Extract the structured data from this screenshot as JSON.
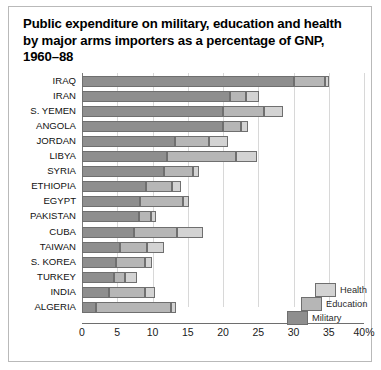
{
  "chart_data": {
    "type": "bar",
    "subtype": "stacked-horizontal",
    "title": "Public expenditure on military, education and health by major arms importers as a percentage of GNP, 1960–88",
    "xlabel": "",
    "ylabel": "",
    "xlim": [
      0,
      40
    ],
    "xticks": [
      0,
      5,
      10,
      15,
      20,
      25,
      30,
      35,
      40
    ],
    "xtick_labels": [
      "0",
      "5",
      "10",
      "15",
      "20",
      "25",
      "30",
      "35",
      "40%"
    ],
    "grid": true,
    "legend_position": "inside-lower-right",
    "categories": [
      "IRAQ",
      "IRAN",
      "S. YEMEN",
      "ANGOLA",
      "JORDAN",
      "LIBYA",
      "SYRIA",
      "ETHIOPIA",
      "EGYPT",
      "PAKISTAN",
      "CUBA",
      "TAIWAN",
      "S. KOREA",
      "TURKEY",
      "INDIA",
      "ALGERIA"
    ],
    "series": [
      {
        "name": "Military",
        "color": "#8e8e8e",
        "values": [
          30.0,
          21.0,
          20.0,
          20.0,
          13.2,
          12.0,
          11.6,
          9.1,
          8.2,
          8.1,
          7.4,
          5.4,
          4.8,
          4.5,
          3.8,
          2.0
        ]
      },
      {
        "name": "Education",
        "color": "#b6b6b6",
        "values": [
          4.4,
          2.3,
          5.8,
          2.5,
          4.8,
          9.9,
          4.1,
          3.7,
          6.1,
          1.7,
          6.1,
          3.8,
          4.1,
          1.6,
          5.2,
          10.6
        ]
      },
      {
        "name": "Health",
        "color": "#d3d3d3",
        "values": [
          0.7,
          1.8,
          2.7,
          1.1,
          2.7,
          2.9,
          0.9,
          1.2,
          0.9,
          0.7,
          3.7,
          2.4,
          1.0,
          1.7,
          1.4,
          0.7
        ]
      }
    ],
    "totals": [
      35.1,
      25.1,
      28.5,
      23.6,
      20.7,
      24.8,
      16.6,
      14.0,
      15.2,
      10.5,
      17.2,
      11.6,
      9.9,
      7.8,
      10.4,
      13.3
    ],
    "legend": [
      "Health",
      "Education",
      "Military"
    ]
  }
}
